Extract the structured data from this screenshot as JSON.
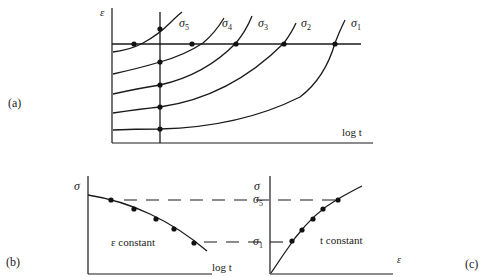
{
  "figure": {
    "panel_a": {
      "label": "(a)",
      "y_axis_label": "ε",
      "x_axis_label": "log t",
      "curves": [
        {
          "name": "σ5",
          "sym": "σ",
          "sub": "5"
        },
        {
          "name": "σ4",
          "sym": "σ",
          "sub": "4"
        },
        {
          "name": "σ3",
          "sym": "σ",
          "sub": "3"
        },
        {
          "name": "σ2",
          "sym": "σ",
          "sub": "2"
        },
        {
          "name": "σ1",
          "sym": "σ",
          "sub": "1"
        }
      ],
      "description": "Creep curves: strain vs log time for stresses σ1 < σ2 < σ3 < σ4 < σ5; horizontal line = constant strain, vertical line = constant time"
    },
    "panel_b": {
      "label": "(b)",
      "y_axis_label": "σ",
      "x_axis_label": "log t",
      "annotation": "ε constant",
      "description": "Isometric: stress vs log time at constant strain"
    },
    "panel_c": {
      "label": "(c)",
      "y_axis_label": "σ",
      "x_axis_label": "ε",
      "annotation": "t constant",
      "tick_top": {
        "sym": "σ",
        "sub": "5"
      },
      "tick_bottom": {
        "sym": "σ",
        "sub": "1"
      },
      "description": "Isochronous: stress vs strain at constant time"
    }
  }
}
